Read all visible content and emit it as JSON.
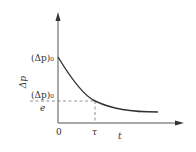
{
  "diagram": {
    "title": "",
    "y_axis": {
      "label": "Δp"
    },
    "x_axis": {
      "label": "t"
    },
    "origin_label": "0",
    "tau_label": "τ",
    "y_start_label": "(Δp)₀",
    "y_tau_label_num": "(Δp)₀",
    "y_tau_label_den": "e",
    "curve": "exponential decay Δp = (Δp)₀ e^(-t/τ)",
    "colors": {
      "axis": "#555555",
      "curve": "#333333",
      "dashed": "#777777"
    }
  }
}
